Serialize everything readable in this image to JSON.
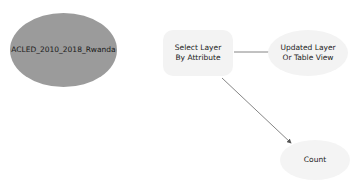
{
  "diagram": {
    "nodes": [
      {
        "id": "input",
        "label": "ACLED_2010_2018_Rwanda",
        "type": "input-data",
        "color": "#9b9b9b"
      },
      {
        "id": "tool",
        "label": "Select Layer By Attribute",
        "type": "tool",
        "color": "#f3f3f3"
      },
      {
        "id": "out1",
        "label": "Updated Layer Or Table View",
        "type": "output",
        "color": "#f3f3f3"
      },
      {
        "id": "out2",
        "label": "Count",
        "type": "output",
        "color": "#f4f4f4"
      }
    ],
    "edges": [
      {
        "from": "tool",
        "to": "out1"
      },
      {
        "from": "tool",
        "to": "out2"
      }
    ],
    "edge_color": "#555555"
  }
}
